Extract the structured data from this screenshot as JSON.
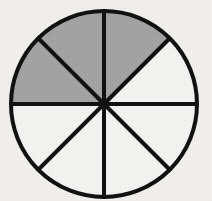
{
  "figure": {
    "caption": "",
    "background_color": "#f5f4f1"
  },
  "chart_data": {
    "type": "pie",
    "title": "",
    "subtitle": "",
    "xlabel": "",
    "ylabel": "",
    "legend_position": "none",
    "grid": false,
    "total_slices": 8,
    "shaded_slices": 3,
    "unshaded_slices": 5,
    "slice_angle_degrees": 45,
    "fraction_shaded": "3/8",
    "fraction_shaded_decimal": 0.375,
    "percent_shaded": 37.5,
    "categories": [
      "sector-1",
      "sector-2",
      "sector-3",
      "sector-4",
      "sector-5",
      "sector-6",
      "sector-7",
      "sector-8"
    ],
    "values": [
      45,
      45,
      45,
      45,
      45,
      45,
      45,
      45
    ],
    "slices": [
      {
        "index": 1,
        "start_deg": 0,
        "end_deg": 45,
        "shaded": false,
        "fill": "#f7f7f5",
        "position": "right-upper"
      },
      {
        "index": 2,
        "start_deg": 45,
        "end_deg": 90,
        "shaded": true,
        "fill": "#a6a6a6",
        "position": "upper-right-inner"
      },
      {
        "index": 3,
        "start_deg": 90,
        "end_deg": 135,
        "shaded": true,
        "fill": "#a6a6a6",
        "position": "upper-left-inner"
      },
      {
        "index": 4,
        "start_deg": 135,
        "end_deg": 180,
        "shaded": true,
        "fill": "#a6a6a6",
        "position": "left-upper"
      },
      {
        "index": 5,
        "start_deg": 180,
        "end_deg": 225,
        "shaded": false,
        "fill": "#f7f7f5",
        "position": "left-lower"
      },
      {
        "index": 6,
        "start_deg": 225,
        "end_deg": 270,
        "shaded": false,
        "fill": "#f7f7f5",
        "position": "lower-left-inner"
      },
      {
        "index": 7,
        "start_deg": 270,
        "end_deg": 315,
        "shaded": false,
        "fill": "#f7f7f5",
        "position": "lower-right-inner"
      },
      {
        "index": 8,
        "start_deg": 315,
        "end_deg": 360,
        "shaded": false,
        "fill": "#f7f7f5",
        "position": "right-lower"
      }
    ],
    "geometry": {
      "center_x": 104,
      "center_y": 104,
      "radius": 93,
      "stroke_color": "#121212",
      "stroke_width": 4,
      "divider_count": 4,
      "divider_angles_deg": [
        0,
        45,
        90,
        135
      ]
    },
    "colors": {
      "shaded": "#a6a6a6",
      "unshaded": "#f7f7f5",
      "outline": "#121212",
      "background": "#f5f4f1"
    }
  }
}
